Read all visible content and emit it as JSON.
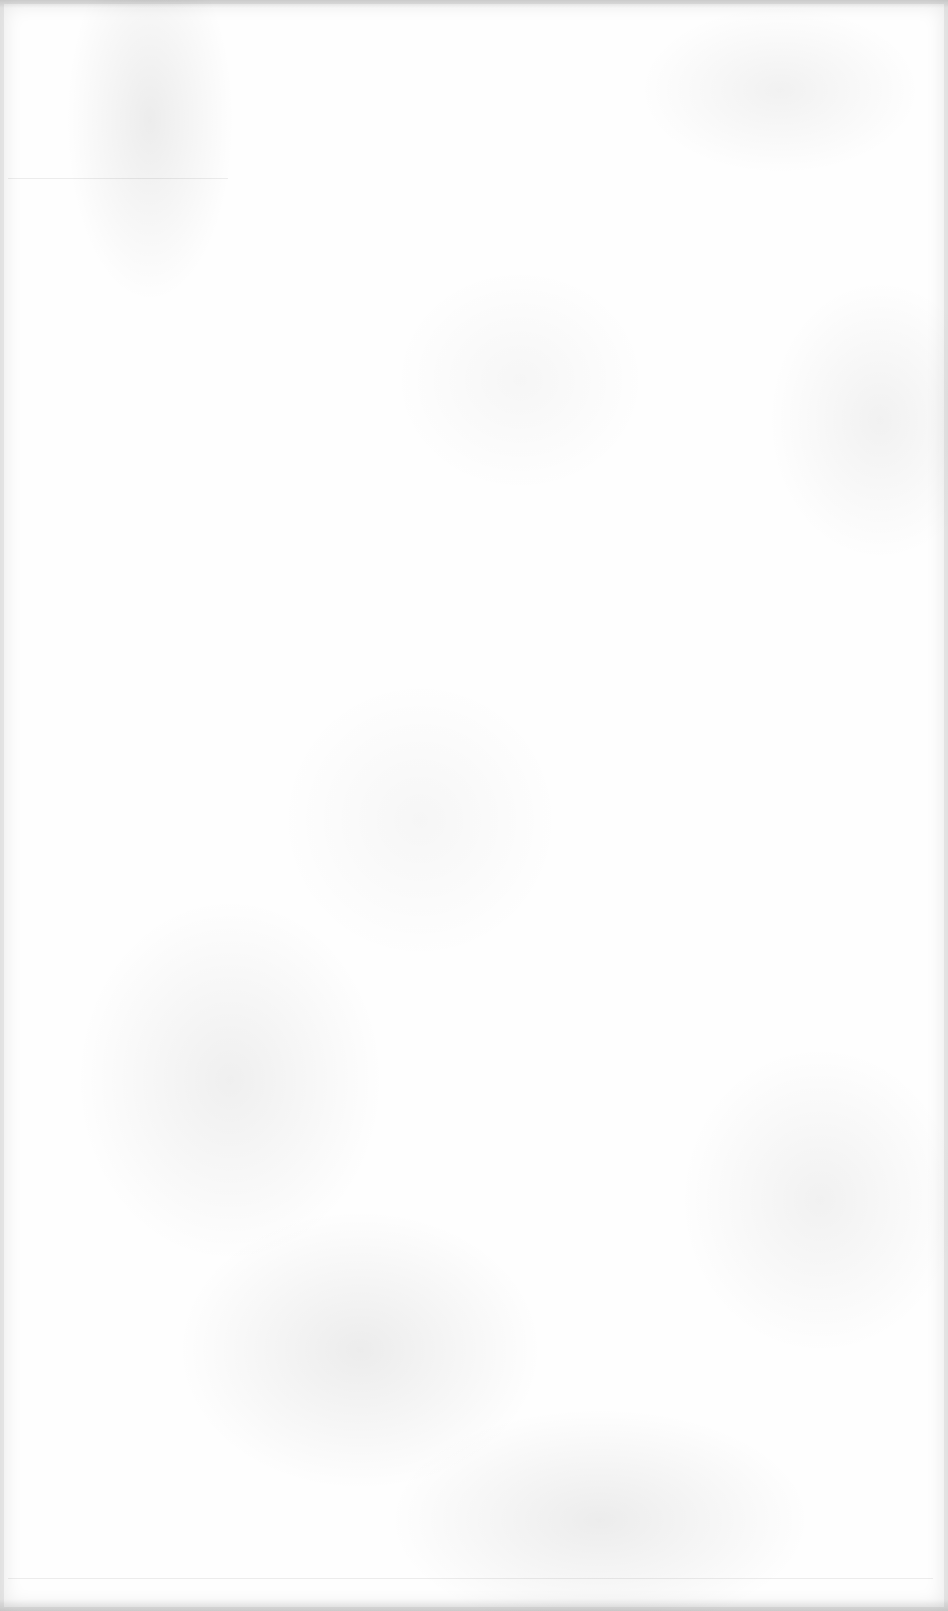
{
  "document": {
    "type": "blank-scanned-page",
    "text": "",
    "background_color": "#fefefe",
    "texture_color": "#d9d9d9",
    "rules": [
      {
        "name": "faint-rule-top",
        "y": 178,
        "x_start": 8,
        "x_end": 228
      },
      {
        "name": "faint-rule-bottom",
        "y": 1578,
        "x_start": 8,
        "x_end": 933
      }
    ]
  }
}
